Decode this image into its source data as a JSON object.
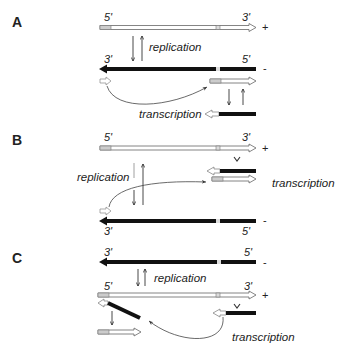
{
  "figure": {
    "panels": [
      {
        "id": "A",
        "label": "A",
        "plus_strand": {
          "five_prime": "5'",
          "three_prime": "3'",
          "sign": "+"
        },
        "minus_strand": {
          "five_prime": "5'",
          "three_prime": "3'",
          "sign": "-"
        },
        "replication_label": "replication",
        "transcription_label": "transcription"
      },
      {
        "id": "B",
        "label": "B",
        "plus_strand": {
          "five_prime": "5'",
          "three_prime": "3'",
          "sign": "+"
        },
        "minus_strand": {
          "five_prime": "5'",
          "three_prime": "3'",
          "sign": "-"
        },
        "replication_label": "replication",
        "transcription_label": "transcription"
      },
      {
        "id": "C",
        "label": "C",
        "minus_strand": {
          "five_prime": "5'",
          "three_prime": "3'",
          "sign": "-"
        },
        "plus_strand": {
          "five_prime": "5'",
          "three_prime": "3'",
          "sign": "+"
        },
        "replication_label": "replication",
        "transcription_label": "transcription"
      }
    ],
    "colors": {
      "dark_strand": "#111111",
      "light_strand_fill": "#ffffff",
      "outline": "#555555",
      "marker": "#cfcfcf"
    }
  }
}
